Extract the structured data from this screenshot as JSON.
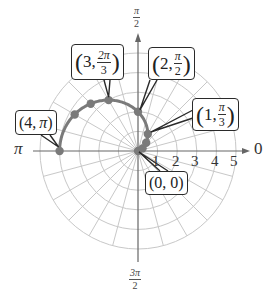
{
  "chart_data": {
    "type": "scatter",
    "subtype": "polar",
    "title": "",
    "equation": "r = 2 - 2cos(theta)",
    "theta_range": [
      "0",
      "pi"
    ],
    "radial_ticks": [
      1,
      2,
      3,
      4,
      5
    ],
    "radial_max": 5,
    "angular_grid_step_deg": 15,
    "angle_labels": {
      "right": "0",
      "top": "π/2",
      "left": "π",
      "bottom": "3π/2"
    },
    "points": [
      {
        "theta_deg": 0,
        "r": 0
      },
      {
        "theta_deg": 30,
        "r": 0.27
      },
      {
        "theta_deg": 45,
        "r": 0.59
      },
      {
        "theta_deg": 60,
        "r": 1
      },
      {
        "theta_deg": 90,
        "r": 2
      },
      {
        "theta_deg": 120,
        "r": 3
      },
      {
        "theta_deg": 135,
        "r": 3.41
      },
      {
        "theta_deg": 150,
        "r": 3.73
      },
      {
        "theta_deg": 180,
        "r": 4
      }
    ],
    "annotations": [
      {
        "label": "(0, 0)",
        "r": 0,
        "theta": "0"
      },
      {
        "label": "(1, π/3)",
        "r": 1,
        "theta": "π/3"
      },
      {
        "label": "(2, π/2)",
        "r": 2,
        "theta": "π/2"
      },
      {
        "label": "(3, 2π/3)",
        "r": 3,
        "theta": "2π/3"
      },
      {
        "label": "(4, π)",
        "r": 4,
        "theta": "π"
      }
    ],
    "grid": true,
    "legend": null,
    "colors": {
      "curve": "#7a7a7a",
      "grid": "#c8c8c8",
      "axis": "#666666",
      "callout_border": "#2a2a2a"
    }
  },
  "axes": {
    "top_label": {
      "num": "π",
      "den": "2"
    },
    "bottom_label": {
      "num": "3π",
      "den": "2"
    },
    "left_label": "π",
    "right_label": "0",
    "ticks": [
      "1",
      "2",
      "3",
      "4",
      "5"
    ]
  },
  "callouts": {
    "origin": {
      "r": "0",
      "theta": "0"
    },
    "p1": {
      "r": "1,",
      "num": "π",
      "den": "3"
    },
    "p2": {
      "r": "2,",
      "num": "π",
      "den": "2"
    },
    "p3": {
      "r": "3,",
      "num": "2π",
      "den": "3"
    },
    "p4": {
      "r": "4,",
      "theta": "π"
    }
  }
}
